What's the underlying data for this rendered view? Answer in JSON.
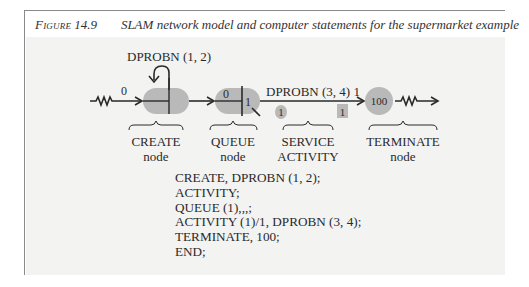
{
  "caption": {
    "label": "Figure",
    "number": "14.9",
    "title": "SLAM network model and computer statements for the supermarket example"
  },
  "diagram": {
    "create_label": "DPROBN (1, 2)",
    "create_first_time": "0",
    "queue_initial": "0",
    "queue_file": "1",
    "activity_label": "DPROBN (3, 4) 1",
    "activity_number_circle": "1",
    "activity_number_box": "1",
    "terminate_count": "100",
    "nodes": [
      {
        "name": "CREATE",
        "type": "node"
      },
      {
        "name": "QUEUE",
        "type": "node"
      },
      {
        "name": "SERVICE",
        "type": "ACTIVITY"
      },
      {
        "name": "TERMINATE",
        "type": "node"
      }
    ],
    "colors": {
      "node_fill": "#b9b9b9",
      "line": "#2a2a2a",
      "background": "#f3f3f2"
    }
  },
  "code": {
    "lines": [
      "CREATE, DPROBN (1, 2);",
      "ACTIVITY;",
      "QUEUE (1),,,;",
      "ACTIVITY (1)/1, DPROBN (3, 4);",
      "TERMINATE, 100;",
      "END;"
    ]
  }
}
